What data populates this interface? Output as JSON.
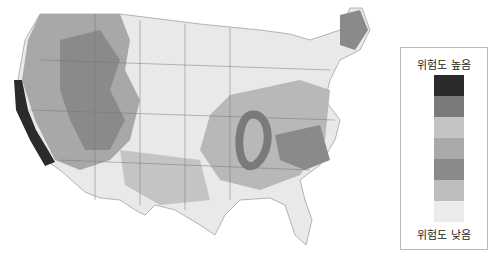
{
  "legend": {
    "high_label": "위험도 높음",
    "low_label": "위험도 낮음",
    "swatches": [
      "#2b2b2b",
      "#7a7a7a",
      "#c4c4c4",
      "#a9a9a9",
      "#8a8a8a",
      "#bdbdbd",
      "#ececec"
    ]
  },
  "map": {
    "subject": "United States hazard risk map (grayscale)",
    "colors": {
      "background": "#ffffff",
      "land_low": "#ececec",
      "border": "#6a6a6a"
    }
  }
}
